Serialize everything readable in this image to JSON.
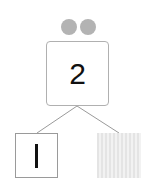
{
  "diagram": {
    "type": "number-bond",
    "whole": {
      "value": "2",
      "dots": 2,
      "dot_color": "#b3b3b3"
    },
    "parts": [
      {
        "value": "1",
        "display": "bar",
        "state": "filled"
      },
      {
        "value": "",
        "display": "empty",
        "state": "hatched-blank",
        "fill_color": "#e8e8e8"
      }
    ],
    "edge_color": "#999999"
  }
}
